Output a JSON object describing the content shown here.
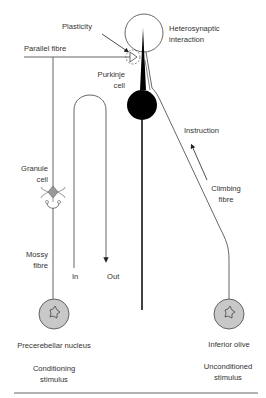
{
  "diagram": {
    "type": "cerebellar-circuit",
    "colors": {
      "line": "#555555",
      "purkinje": "#000000",
      "nucleus_fill": "#c8c8c8",
      "text": "#333333",
      "divider": "#555555"
    },
    "labels": {
      "plasticity": "Plasticity",
      "heterosynaptic_1": "Heterosynaptic",
      "heterosynaptic_2": "interaction",
      "parallel_fibre": "Parallel fibre",
      "purkinje_1": "Purkinje",
      "purkinje_2": "cell",
      "instruction": "Instruction",
      "climbing_1": "Climbing",
      "climbing_2": "fibre",
      "granule_1": "Granule",
      "granule_2": "cell",
      "mossy_1": "Mossy",
      "mossy_2": "fibre",
      "in": "In",
      "out": "Out",
      "precerebellar": "Precerebellar nucleus",
      "inferior_olive": "Inferior olive",
      "conditioning_1": "Conditioning",
      "conditioning_2": "stimulus",
      "unconditioned_1": "Unconditioned",
      "unconditioned_2": "stimulus"
    }
  }
}
